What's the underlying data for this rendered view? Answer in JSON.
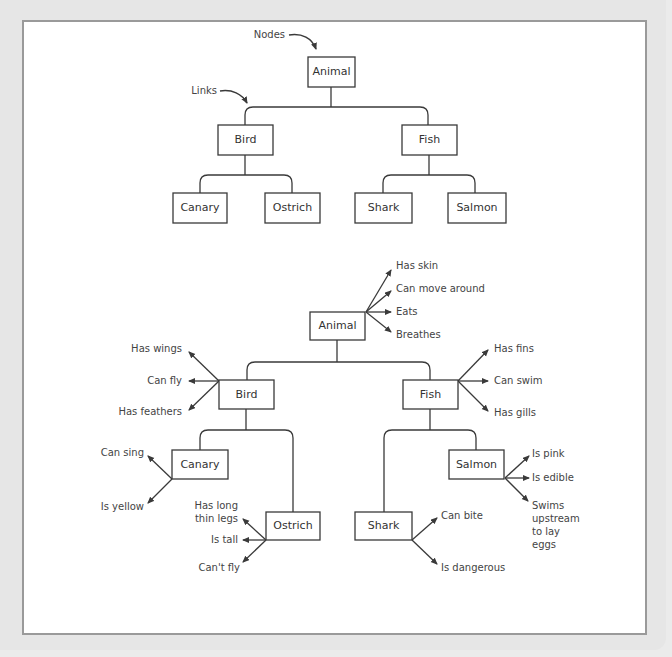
{
  "annotations": {
    "nodes_label": "Nodes",
    "links_label": "Links"
  },
  "top_tree": {
    "root": "Animal",
    "bird": "Bird",
    "fish": "Fish",
    "canary": "Canary",
    "ostrich": "Ostrich",
    "shark": "Shark",
    "salmon": "Salmon"
  },
  "bottom_tree": {
    "root": {
      "label": "Animal",
      "properties": [
        "Has skin",
        "Can move around",
        "Eats",
        "Breathes"
      ]
    },
    "bird": {
      "label": "Bird",
      "properties": [
        "Has wings",
        "Can fly",
        "Has feathers"
      ]
    },
    "fish": {
      "label": "Fish",
      "properties": [
        "Has fins",
        "Can swim",
        "Has gills"
      ]
    },
    "canary": {
      "label": "Canary",
      "properties": [
        "Can sing",
        "Is yellow"
      ]
    },
    "ostrich": {
      "label": "Ostrich",
      "properties": [
        "Has long",
        "thin legs",
        "Is tall",
        "Can't fly"
      ]
    },
    "shark": {
      "label": "Shark",
      "properties": [
        "Can bite",
        "Is dangerous"
      ]
    },
    "salmon": {
      "label": "Salmon",
      "properties": [
        "Is pink",
        "Is edible",
        "Swims",
        "upstream",
        "to lay",
        "eggs"
      ]
    }
  },
  "colors": {
    "line": "#3a3a3a",
    "text": "#333333",
    "panel_border": "#9a9a9a",
    "background": "#e6e6e6"
  }
}
